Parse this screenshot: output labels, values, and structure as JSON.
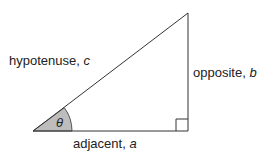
{
  "diagram": {
    "type": "right-triangle",
    "angle_symbol": "θ",
    "labels": {
      "hypotenuse": {
        "text": "hypotenuse, ",
        "var": "c"
      },
      "opposite": {
        "text": "opposite, ",
        "var": "b"
      },
      "adjacent": {
        "text": "adjacent, ",
        "var": "a"
      }
    },
    "colors": {
      "stroke": "#333333",
      "angle_fill": "#bdbdbd"
    }
  }
}
